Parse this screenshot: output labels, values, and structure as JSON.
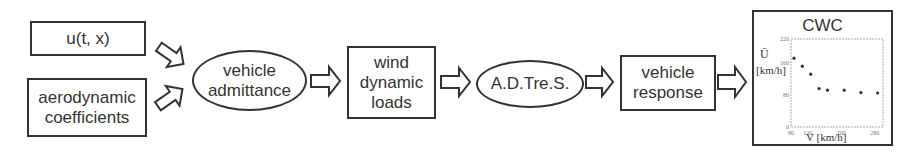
{
  "diagram": {
    "nodes": [
      {
        "id": "input-wind",
        "shape": "rectangle",
        "label": "u(t, x)"
      },
      {
        "id": "input-aero",
        "shape": "rectangle",
        "label": "aerodynamic\ncoefficients"
      },
      {
        "id": "vehicle-admittance",
        "shape": "ellipse",
        "label": "vehicle\nadmittance"
      },
      {
        "id": "wind-dynamic-loads",
        "shape": "rectangle",
        "label": "wind\ndynamic\nloads"
      },
      {
        "id": "adtres",
        "shape": "ellipse",
        "label": "A.D.Tre.S."
      },
      {
        "id": "vehicle-response",
        "shape": "rectangle",
        "label": "vehicle\nresponse"
      },
      {
        "id": "cwc-chart",
        "shape": "chart-box",
        "label": "CWC"
      }
    ],
    "edges": [
      {
        "from": "input-wind",
        "to": "vehicle-admittance",
        "style": "hollow-block-arrow"
      },
      {
        "from": "input-aero",
        "to": "vehicle-admittance",
        "style": "hollow-block-arrow"
      },
      {
        "from": "vehicle-admittance",
        "to": "wind-dynamic-loads",
        "style": "hollow-block-arrow"
      },
      {
        "from": "wind-dynamic-loads",
        "to": "adtres",
        "style": "hollow-block-arrow"
      },
      {
        "from": "adtres",
        "to": "vehicle-response",
        "style": "hollow-block-arrow"
      },
      {
        "from": "vehicle-response",
        "to": "cwc-chart",
        "style": "hollow-block-arrow"
      }
    ],
    "colors": {
      "stroke": "#333333",
      "fill": "#ffffff",
      "chart_frame": "#999999",
      "points": "#333333"
    }
  },
  "chart_data": {
    "type": "scatter",
    "title": "CWC",
    "xlabel": "V [km/h]",
    "ylabel": "U [km/h]",
    "ylabel_symbol": "Ū",
    "ylabel_unit": "[km/h]",
    "xlim": [
      80,
      300
    ],
    "ylim": [
      0,
      220
    ],
    "xticks": [
      "80",
      "120",
      "200",
      "280"
    ],
    "yticks": [
      "0",
      "80",
      "160",
      "220"
    ],
    "x": [
      80,
      100,
      120,
      140,
      160,
      200,
      240,
      280
    ],
    "values": [
      172,
      152,
      132,
      96,
      92,
      92,
      86,
      85
    ],
    "grid": false
  }
}
